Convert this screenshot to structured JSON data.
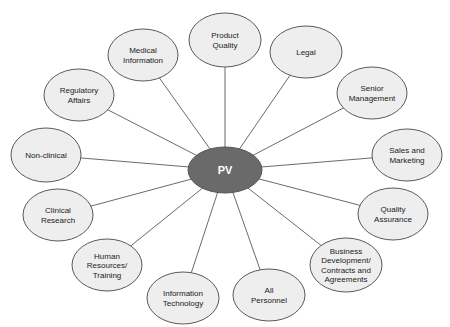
{
  "diagram": {
    "type": "hub-and-spoke",
    "hub": {
      "label": "PV",
      "cx": 225,
      "cy": 170,
      "rx": 37,
      "ry": 23,
      "fill": "#6a6a6a"
    },
    "node_fill": "#eeeeee",
    "nodes": [
      {
        "id": "product-quality",
        "lines": [
          "Product",
          "Quality"
        ],
        "cx": 225,
        "cy": 40,
        "rx": 36,
        "ry": 27
      },
      {
        "id": "legal",
        "lines": [
          "Legal"
        ],
        "cx": 306,
        "cy": 52,
        "rx": 36,
        "ry": 26
      },
      {
        "id": "senior-management",
        "lines": [
          "Senior",
          "Management"
        ],
        "cx": 372,
        "cy": 93,
        "rx": 35,
        "ry": 26
      },
      {
        "id": "sales-and-marketing",
        "lines": [
          "Sales and",
          "Marketing"
        ],
        "cx": 407,
        "cy": 155,
        "rx": 35,
        "ry": 26
      },
      {
        "id": "quality-assurance",
        "lines": [
          "Quality",
          "Assurance"
        ],
        "cx": 393,
        "cy": 214,
        "rx": 35,
        "ry": 26
      },
      {
        "id": "business-development",
        "lines": [
          "Business",
          "Development/",
          "Contracts and",
          "Agreements"
        ],
        "cx": 346,
        "cy": 265,
        "rx": 36,
        "ry": 27
      },
      {
        "id": "all-personnel",
        "lines": [
          "All",
          "Personnel"
        ],
        "cx": 269,
        "cy": 295,
        "rx": 36,
        "ry": 26
      },
      {
        "id": "information-technology",
        "lines": [
          "Information",
          "Technology"
        ],
        "cx": 183,
        "cy": 298,
        "rx": 36,
        "ry": 26
      },
      {
        "id": "human-resources-training",
        "lines": [
          "Human",
          "Resources/",
          "Training"
        ],
        "cx": 107,
        "cy": 265,
        "rx": 35,
        "ry": 26
      },
      {
        "id": "clinical-research",
        "lines": [
          "Clinical",
          "Research"
        ],
        "cx": 58,
        "cy": 215,
        "rx": 35,
        "ry": 26
      },
      {
        "id": "non-clinical",
        "lines": [
          "Non-clinical"
        ],
        "cx": 46,
        "cy": 155,
        "rx": 35,
        "ry": 27
      },
      {
        "id": "regulatory-affairs",
        "lines": [
          "Regulatory",
          "Affairs"
        ],
        "cx": 79,
        "cy": 95,
        "rx": 35,
        "ry": 26
      },
      {
        "id": "medical-information",
        "lines": [
          "Medical",
          "Information"
        ],
        "cx": 143,
        "cy": 55,
        "rx": 35,
        "ry": 26
      }
    ]
  }
}
